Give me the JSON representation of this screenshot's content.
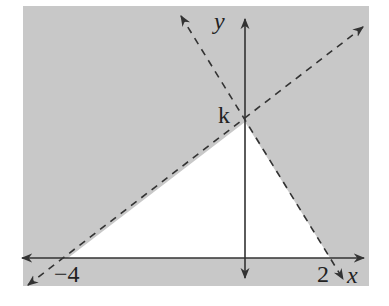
{
  "diagram": {
    "type": "coordinate-plane-inequality-region",
    "colors": {
      "shaded": "#c8c8c8",
      "unshaded": "#ffffff",
      "axis": "#333333",
      "dashed": "#333333"
    },
    "axes": {
      "x_label": "x",
      "y_label": "y"
    },
    "points": {
      "x_intercept_left": "−4",
      "x_intercept_right": "2",
      "y_intercept": "k"
    },
    "lines": [
      {
        "name": "line-through-neg4-and-k",
        "style": "dashed",
        "from": [
          -4,
          0
        ],
        "to": [
          0,
          "k"
        ]
      },
      {
        "name": "line-through-k-and-2",
        "style": "dashed",
        "from": [
          0,
          "k"
        ],
        "to": [
          2,
          0
        ]
      }
    ],
    "unshaded_region": "triangle with vertices (-4,0), (0,k), (2,0)"
  }
}
